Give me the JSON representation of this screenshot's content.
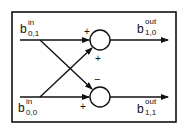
{
  "diagram": {
    "type": "butterfly",
    "inputs": [
      {
        "base": "b",
        "sup": "in",
        "sub": "0,1"
      },
      {
        "base": "b",
        "sup": "in",
        "sub": "0,0"
      }
    ],
    "outputs": [
      {
        "base": "b",
        "sup": "out",
        "sub": "1,0"
      },
      {
        "base": "b",
        "sup": "out",
        "sub": "1,1"
      }
    ],
    "signs": {
      "top_node_straight": "+",
      "top_node_cross": "+",
      "bottom_node_cross": "−",
      "bottom_node_straight": "+"
    }
  }
}
